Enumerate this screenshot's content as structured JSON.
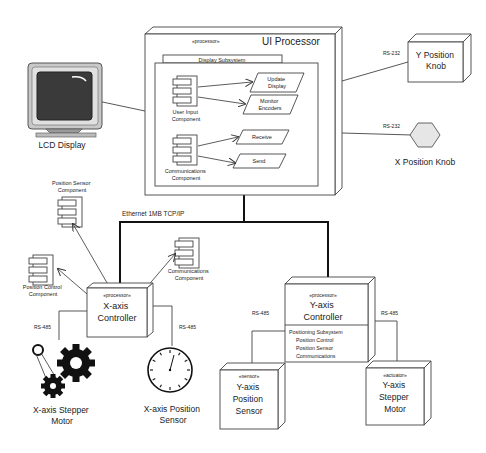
{
  "ui_processor": {
    "stereotype": "«processor»",
    "title": "UI Processor",
    "subsystem": "Display Subsystem",
    "user_input_component": [
      "User Input",
      "Component"
    ],
    "communications_component": [
      "Communications",
      "Component"
    ],
    "actions": {
      "update_display": [
        "Update",
        "Display"
      ],
      "monitor_encoders": [
        "Monitor",
        "Encoders"
      ],
      "receive": "Receive",
      "send": "Send"
    }
  },
  "lcd_display": {
    "label": "LCD Display"
  },
  "y_position_knob": {
    "label": [
      "Y Position",
      "Knob"
    ],
    "link": "RS-232"
  },
  "x_position_knob": {
    "label": "X Position Knob",
    "link": "RS-232"
  },
  "bus": {
    "label": "Ethernet 1MB TCP/IP"
  },
  "x_controller": {
    "stereotype": "«processor»",
    "title": [
      "X-axis",
      "Controller"
    ],
    "position_sensor_component": [
      "Position Sensor",
      "Component"
    ],
    "position_control_component": [
      "Position Control",
      "Component"
    ],
    "communications_component": [
      "Communications",
      "Component"
    ],
    "link_left": "RS-485",
    "link_right": "RS-485"
  },
  "x_stepper_motor": {
    "label": [
      "X-axis Stepper",
      "Motor"
    ]
  },
  "x_position_sensor": {
    "label": [
      "X-axis Position",
      "Sensor"
    ]
  },
  "y_controller": {
    "stereotype": "«processor»",
    "title": [
      "Y-axis",
      "Controller"
    ],
    "subsystem_lines": [
      "Positioning Subsystem",
      "Position Control",
      "Position Sensor",
      "Communications"
    ],
    "link_left": "RS-485",
    "link_right": "RS-485"
  },
  "y_position_sensor": {
    "stereotype": "«sensor»",
    "title": [
      "Y-axis",
      "Position",
      "Sensor"
    ]
  },
  "y_stepper_motor": {
    "stereotype": "«actuator»",
    "title": [
      "Y-axis",
      "Stepper",
      "Motor"
    ]
  }
}
